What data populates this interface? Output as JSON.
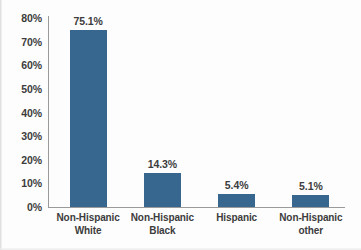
{
  "chart_data": {
    "type": "bar",
    "title": "",
    "subtitle": "",
    "xlabel": "",
    "ylabel": "",
    "categories": [
      "Non-Hispanic White",
      "Non-Hispanic Black",
      "Hispanic",
      "Non-Hispanic other"
    ],
    "category_lines": [
      [
        "Non-Hispanic",
        "White"
      ],
      [
        "Non-Hispanic",
        "Black"
      ],
      [
        "Hispanic",
        ""
      ],
      [
        "Non-Hispanic",
        "other"
      ]
    ],
    "values": [
      75.1,
      14.3,
      5.4,
      5.1
    ],
    "value_labels": [
      "75.1%",
      "14.3%",
      "5.4%",
      "5.1%"
    ],
    "ylim": [
      0,
      80
    ],
    "ytick_values": [
      0,
      10,
      20,
      30,
      40,
      50,
      60,
      70,
      80
    ],
    "ytick_labels": [
      "0%",
      "10%",
      "20%",
      "30%",
      "40%",
      "50%",
      "60%",
      "70%",
      "80%"
    ],
    "grid": false,
    "legend": false,
    "legend_position": "none",
    "bar_color": "#37678f",
    "axis_color": "#9a9a9a",
    "text_color": "#3c3c3c",
    "background_color": "#fdfdfd"
  }
}
